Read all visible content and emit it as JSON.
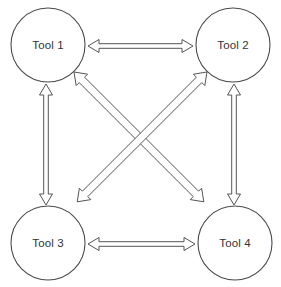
{
  "diagram": {
    "background_color": "#ffffff",
    "node_fill_color": "#ffffff",
    "node_stroke_color": "#4a4a4a",
    "connector_stroke_color": "#555555",
    "label_color": "#333333",
    "nodes": [
      {
        "id": "tool1",
        "label": "Tool 1",
        "cx": 48,
        "cy": 45,
        "r": 37
      },
      {
        "id": "tool2",
        "label": "Tool 2",
        "cx": 233,
        "cy": 45,
        "r": 37
      },
      {
        "id": "tool3",
        "label": "Tool 3",
        "cx": 48,
        "cy": 243,
        "r": 37
      },
      {
        "id": "tool4",
        "label": "Tool 4",
        "cx": 235,
        "cy": 243,
        "r": 37
      }
    ],
    "connectors": [
      {
        "id": "tool1-tool2",
        "from": "tool1",
        "to": "tool2",
        "style": "double-headed-block-arrow",
        "orientation": "horizontal"
      },
      {
        "id": "tool3-tool4",
        "from": "tool3",
        "to": "tool4",
        "style": "double-headed-block-arrow",
        "orientation": "horizontal"
      },
      {
        "id": "tool1-tool3",
        "from": "tool1",
        "to": "tool3",
        "style": "double-headed-block-arrow",
        "orientation": "vertical"
      },
      {
        "id": "tool2-tool4",
        "from": "tool2",
        "to": "tool4",
        "style": "double-headed-block-arrow",
        "orientation": "vertical"
      },
      {
        "id": "tool1-tool4",
        "from": "tool1",
        "to": "tool4",
        "style": "double-headed-block-arrow",
        "orientation": "diagonal"
      },
      {
        "id": "tool2-tool3",
        "from": "tool2",
        "to": "tool3",
        "style": "double-headed-block-arrow",
        "orientation": "diagonal"
      }
    ]
  }
}
